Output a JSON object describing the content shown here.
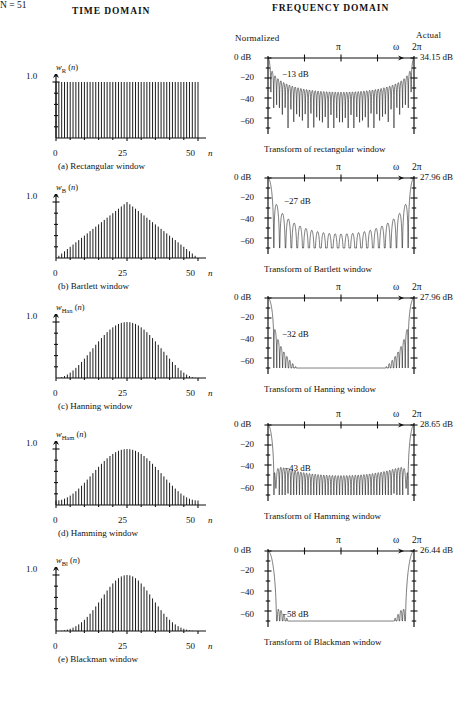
{
  "headers": {
    "time_domain": "TIME  DOMAIN",
    "frequency_domain": "FREQUENCY  DOMAIN",
    "n_value": "N = 51",
    "normalized": "Normalized",
    "actual": "Actual"
  },
  "axis": {
    "time_y_top": "1.0",
    "time_x_0": "0",
    "time_x_mid": "25",
    "time_x_end": "50",
    "time_x_var": "n",
    "freq_y_0": "0 dB",
    "freq_y_20": "−20",
    "freq_y_40": "−40",
    "freq_y_60": "−60",
    "freq_top_pi": "π",
    "freq_top_omega": "ω",
    "freq_top_2pi": "2π"
  },
  "rows": [
    {
      "id": "rectangular",
      "time": {
        "fn_label_base": "w",
        "fn_label_sub": "R",
        "fn_label_arg": "(n)",
        "caption": "(a)  Rectangular window"
      },
      "freq": {
        "peak_db": "34.15 dB",
        "sidelobe_db": "−13 dB",
        "caption": "Transform of rectangular window"
      }
    },
    {
      "id": "bartlett",
      "time": {
        "fn_label_base": "w",
        "fn_label_sub": "B",
        "fn_label_arg": "(n)",
        "caption": "(b)  Bartlett window"
      },
      "freq": {
        "peak_db": "27.96 dB",
        "sidelobe_db": "−27 dB",
        "caption": "Transform of Bartlett window"
      }
    },
    {
      "id": "hanning",
      "time": {
        "fn_label_base": "w",
        "fn_label_sub": "Han",
        "fn_label_arg": "(n)",
        "caption": "(c)  Hanning window"
      },
      "freq": {
        "peak_db": "27.96 dB",
        "sidelobe_db": "−32 dB",
        "caption": "Transform of Hanning window"
      }
    },
    {
      "id": "hamming",
      "time": {
        "fn_label_base": "w",
        "fn_label_sub": "Ham",
        "fn_label_arg": "(n)",
        "caption": "(d)  Hamming window"
      },
      "freq": {
        "peak_db": "28.65 dB",
        "sidelobe_db": "−43 dB",
        "caption": "Transform of Hamming window"
      }
    },
    {
      "id": "blackman",
      "time": {
        "fn_label_base": "w",
        "fn_label_sub": "Bl",
        "fn_label_arg": "(n)",
        "caption": "(e)  Blackman window"
      },
      "freq": {
        "peak_db": "26.44 dB",
        "sidelobe_db": "−58 dB",
        "caption": "Transform of Blackman window"
      }
    }
  ],
  "chart_data": [
    {
      "type": "line",
      "id": "rectangular-time",
      "title": "(a)  Rectangular window",
      "xlabel": "n",
      "ylabel": "w_R (n)",
      "xlim": [
        0,
        50
      ],
      "ylim": [
        0,
        1.15
      ],
      "yticks": [
        1.0
      ],
      "xticks": [
        0,
        25,
        50
      ],
      "grid": false,
      "window": "rectangular",
      "N": 51,
      "description": "Stem plot: all 51 samples equal 1.0 for 0 <= n <= 50"
    },
    {
      "type": "line",
      "id": "rectangular-freq",
      "title": "Transform of rectangular window",
      "xlabel": "ω",
      "ylabel": "dB",
      "xlim": [
        0,
        6.2832
      ],
      "ylim": [
        -70,
        2
      ],
      "yticks": [
        0,
        -20,
        -40,
        -60
      ],
      "xticks": [
        "0",
        "π/2",
        "π",
        "3π/2",
        "2π"
      ],
      "peak_db": 34.15,
      "first_sidelobe_db": -13,
      "mainlobe_halfwidth_rad": 0.1232,
      "grid": false
    },
    {
      "type": "line",
      "id": "bartlett-time",
      "title": "(b)  Bartlett window",
      "xlabel": "n",
      "ylabel": "w_B (n)",
      "xlim": [
        0,
        50
      ],
      "ylim": [
        0,
        1.15
      ],
      "yticks": [
        1.0
      ],
      "xticks": [
        0,
        25,
        50
      ],
      "window": "bartlett",
      "N": 51,
      "description": "Triangular: rises linearly 0 to 1.0 at n=25, falls linearly to 0 at n=50"
    },
    {
      "type": "line",
      "id": "bartlett-freq",
      "title": "Transform of Bartlett window",
      "xlabel": "ω",
      "ylabel": "dB",
      "xlim": [
        0,
        6.2832
      ],
      "ylim": [
        -70,
        2
      ],
      "yticks": [
        0,
        -20,
        -40,
        -60
      ],
      "peak_db": 27.96,
      "first_sidelobe_db": -27,
      "grid": false
    },
    {
      "type": "line",
      "id": "hanning-time",
      "title": "(c)  Hanning window",
      "xlabel": "n",
      "ylabel": "w_Han (n)",
      "xlim": [
        0,
        50
      ],
      "ylim": [
        0,
        1.15
      ],
      "yticks": [
        1.0
      ],
      "xticks": [
        0,
        25,
        50
      ],
      "window": "hanning",
      "N": 51,
      "description": "Raised cosine 0.5 - 0.5 cos(2 pi n / 50), peak 1.0 at n=25"
    },
    {
      "type": "line",
      "id": "hanning-freq",
      "title": "Transform of Hanning window",
      "xlabel": "ω",
      "ylabel": "dB",
      "xlim": [
        0,
        6.2832
      ],
      "ylim": [
        -70,
        2
      ],
      "yticks": [
        0,
        -20,
        -40,
        -60
      ],
      "peak_db": 27.96,
      "first_sidelobe_db": -32,
      "grid": false
    },
    {
      "type": "line",
      "id": "hamming-time",
      "title": "(d)  Hamming window",
      "xlabel": "n",
      "ylabel": "w_Ham (n)",
      "xlim": [
        0,
        50
      ],
      "ylim": [
        0,
        1.15
      ],
      "yticks": [
        1.0
      ],
      "xticks": [
        0,
        25,
        50
      ],
      "window": "hamming",
      "N": 51,
      "description": "0.54 - 0.46 cos(2 pi n / 50), peak 1.0 at n=25, endpoints 0.08"
    },
    {
      "type": "line",
      "id": "hamming-freq",
      "title": "Transform of Hamming window",
      "xlabel": "ω",
      "ylabel": "dB",
      "xlim": [
        0,
        6.2832
      ],
      "ylim": [
        -70,
        2
      ],
      "yticks": [
        0,
        -20,
        -40,
        -60
      ],
      "peak_db": 28.65,
      "first_sidelobe_db": -43,
      "grid": false
    },
    {
      "type": "line",
      "id": "blackman-time",
      "title": "(e)  Blackman window",
      "xlabel": "n",
      "ylabel": "w_Bl (n)",
      "xlim": [
        0,
        50
      ],
      "ylim": [
        0,
        1.15
      ],
      "yticks": [
        1.0
      ],
      "xticks": [
        0,
        25,
        50
      ],
      "window": "blackman",
      "N": 51,
      "description": "0.42 - 0.5 cos(2 pi n / 50) + 0.08 cos(4 pi n / 50), peak 1.0 at n=25"
    },
    {
      "type": "line",
      "id": "blackman-freq",
      "title": "Transform of Blackman window",
      "xlabel": "ω",
      "ylabel": "dB",
      "xlim": [
        0,
        6.2832
      ],
      "ylim": [
        -70,
        2
      ],
      "yticks": [
        0,
        -20,
        -40,
        -60
      ],
      "peak_db": 26.44,
      "first_sidelobe_db": -58,
      "grid": false
    }
  ]
}
